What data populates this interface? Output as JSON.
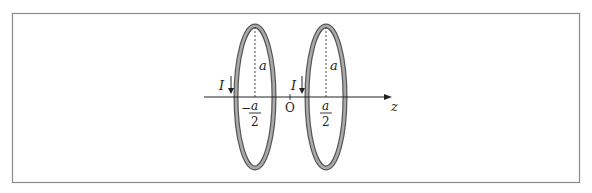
{
  "diagram": {
    "axis": {
      "label": "z",
      "origin_label": "O"
    },
    "loops": [
      {
        "position_numerator": "a",
        "position_denominator": "2",
        "position_sign": "−",
        "radius_label": "a",
        "current_label": "I"
      },
      {
        "position_numerator": "a",
        "position_denominator": "2",
        "position_sign": "",
        "radius_label": "a",
        "current_label": "I"
      }
    ],
    "colors": {
      "frame": "#8a8a8a",
      "ring_outer": "#555555",
      "ring_fill": "#a8a8a8",
      "axis": "#222222"
    }
  }
}
